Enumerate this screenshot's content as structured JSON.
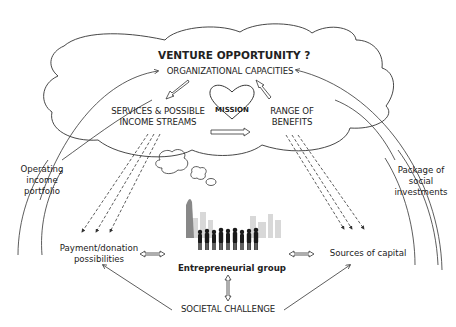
{
  "diagram": {
    "title": "VENTURE OPPORTUNITY ?",
    "nodes": {
      "organizational_capacities": "ORGANIZATIONAL CAPACITIES",
      "services_line1": "SERVICES & POSSIBLE",
      "services_line2": "INCOME STREAMS",
      "mission": "MISSION",
      "benefits_line1": "RANGE OF",
      "benefits_line2": "BENEFITS",
      "operating_line1": "Operating",
      "operating_line2": "income",
      "operating_line3": "portfolio",
      "package_line1": "Package of",
      "package_line2": "social",
      "package_line3": "investments",
      "payment_line1": "Payment/donation",
      "payment_line2": "possibilities",
      "entrepreneurial_group": "Entrepreneurial group",
      "sources_of_capital": "Sources of capital",
      "societal_challenge": "SOCIETAL CHALLENGE"
    },
    "colors": {
      "line": "#333333",
      "text": "#222222",
      "background": "#ffffff"
    }
  }
}
